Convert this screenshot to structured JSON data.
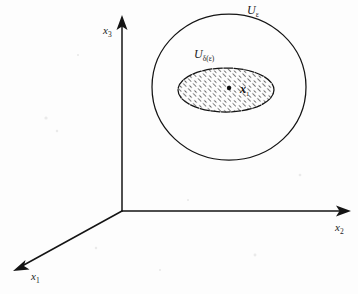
{
  "figure": {
    "background_color": "#fdfdfd",
    "ink_color": "#141414"
  },
  "axes": {
    "origin": {
      "x": 122,
      "y": 211
    },
    "items": [
      {
        "name": "x3-axis",
        "base_label": "x",
        "subscript": "3",
        "label_x": 103,
        "label_y": 34,
        "direction": "up",
        "tip": {
          "x": 122,
          "y": 17
        }
      },
      {
        "name": "x2-axis",
        "base_label": "x",
        "subscript": "2",
        "label_x": 335,
        "label_y": 231,
        "direction": "right",
        "tip": {
          "x": 350,
          "y": 211
        }
      },
      {
        "name": "x1-axis",
        "base_label": "x",
        "subscript": "1",
        "label_x": 31,
        "label_y": 280,
        "direction": "lower-left",
        "tip": {
          "x": 14,
          "y": 272
        }
      }
    ]
  },
  "regions": [
    {
      "name": "outer-epsilon-neighborhood",
      "base_label": "U",
      "subscript": "ε",
      "label_x": 247,
      "label_y": 14,
      "center_x": 229,
      "center_y": 87,
      "radius_x": 77,
      "radius_y": 73,
      "filled": false
    },
    {
      "name": "inner-delta-neighborhood",
      "base_label": "U",
      "subscript": "δ(ε)",
      "label_x": 194,
      "label_y": 58,
      "center_x": 226,
      "center_y": 90,
      "radius_x": 48,
      "radius_y": 22,
      "filled": true,
      "fill_pattern": "diagonal-hatch"
    }
  ],
  "markers": [
    {
      "name": "center-point",
      "type": "dot",
      "x": 229,
      "y": 88,
      "radius": 2.2
    },
    {
      "name": "state-point",
      "type": "cross-label",
      "base_label": "x",
      "subscript": "1",
      "x": 242,
      "y": 93
    }
  ]
}
